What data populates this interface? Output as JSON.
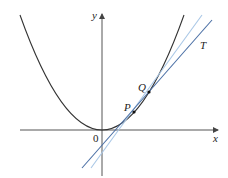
{
  "diagram": {
    "axes": {
      "x_label": "x",
      "y_label": "y",
      "origin_label": "0"
    },
    "curve": {
      "type": "parabola",
      "equation": "y = x^2",
      "color": "#333333"
    },
    "points": [
      {
        "label": "P",
        "x": 134,
        "y": 112
      },
      {
        "label": "Q",
        "x": 149,
        "y": 92
      }
    ],
    "lines": [
      {
        "name": "secant-PQ",
        "label": "",
        "color": "#a9c7e6"
      },
      {
        "name": "tangent-T",
        "label": "T",
        "color": "#4a6fa5"
      }
    ],
    "colors": {
      "axis": "#555555",
      "curve": "#333333",
      "secant": "#a9c7e6",
      "tangent": "#4a6fa5"
    }
  }
}
